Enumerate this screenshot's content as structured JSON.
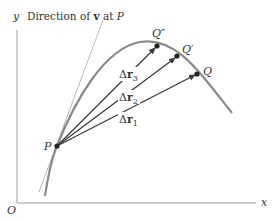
{
  "figure": {
    "axes": {
      "x_label": "x",
      "y_label": "y",
      "origin_label": "O"
    },
    "tangent_caption": {
      "prefix": "Direction of ",
      "vector": "v",
      "suffix": " at ",
      "point": "P"
    },
    "points": {
      "P": "P",
      "Q": "Q",
      "Q_prime": "Q′",
      "Q_double_prime": "Q″"
    },
    "displacements": [
      {
        "delta": "Δ",
        "vector": "r",
        "sub": "1"
      },
      {
        "delta": "Δ",
        "vector": "r",
        "sub": "2"
      },
      {
        "delta": "Δ",
        "vector": "r",
        "sub": "3"
      }
    ],
    "colors": {
      "curve": "#8a8a8a",
      "axes": "#9a9a9a",
      "vectors": "#3a3a3a",
      "tangent": "#b0b0b0",
      "points": "#222222"
    }
  }
}
